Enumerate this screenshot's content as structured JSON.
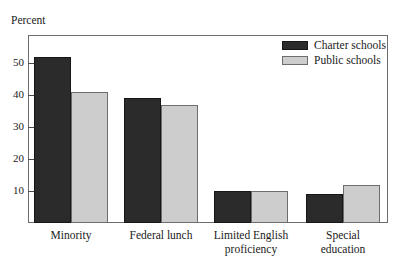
{
  "figure": {
    "top_fragment": "· · · · · · · · ·",
    "axis_title": "Percent"
  },
  "legend": {
    "position": "top-right",
    "items": [
      {
        "label": "Charter schools",
        "color": "#2b2b2b",
        "swatch": "filled-dark-swatch"
      },
      {
        "label": "Public schools",
        "color": "#cdcdcd",
        "swatch": "filled-light-swatch"
      }
    ]
  },
  "yaxis": {
    "ticks": [
      {
        "label": "50",
        "value": 50
      },
      {
        "label": "40",
        "value": 40
      },
      {
        "label": "30",
        "value": 30
      },
      {
        "label": "20",
        "value": 20
      },
      {
        "label": "10",
        "value": 10
      }
    ]
  },
  "xaxis": {
    "categories": [
      "Minority",
      "Federal lunch",
      "Limited English\nproficiency",
      "Special\neducation"
    ]
  },
  "chart_data": {
    "type": "bar",
    "title": "",
    "xlabel": "",
    "ylabel": "Percent",
    "ylim": [
      0,
      56
    ],
    "grid": false,
    "legend_position": "top-right",
    "categories": [
      "Minority",
      "Federal lunch",
      "Limited English proficiency",
      "Special education"
    ],
    "series": [
      {
        "name": "Charter schools",
        "color": "#2b2b2b",
        "values": [
          52,
          39,
          10,
          9
        ]
      },
      {
        "name": "Public schools",
        "color": "#cdcdcd",
        "values": [
          41,
          37,
          10,
          12
        ]
      }
    ]
  }
}
